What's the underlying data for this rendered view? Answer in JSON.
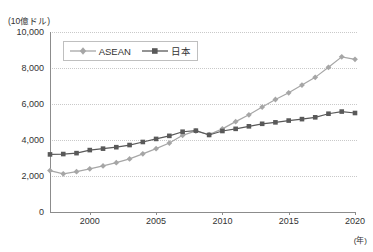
{
  "chart_data": {
    "type": "line",
    "title": "",
    "subtitle": "",
    "xlabel": "(年)",
    "ylabel": "(10億ドル)",
    "unit_label": "(10億ドル)",
    "year_label": "(年)",
    "xlim": [
      1997,
      2020
    ],
    "ylim": [
      0,
      10000
    ],
    "ytick_labels": [
      "0",
      "2,000",
      "4,000",
      "6,000",
      "8,000",
      "10,000"
    ],
    "ytick_values": [
      0,
      2000,
      4000,
      6000,
      8000,
      10000
    ],
    "xtick_labels": [
      "2000",
      "2005",
      "2010",
      "2015",
      "2020"
    ],
    "xtick_values": [
      2000,
      2005,
      2010,
      2015,
      2020
    ],
    "grid": true,
    "legend_position": "top-left-inside",
    "x": [
      1997,
      1998,
      1999,
      2000,
      2001,
      2002,
      2003,
      2004,
      2005,
      2006,
      2007,
      2008,
      2009,
      2010,
      2011,
      2012,
      2013,
      2014,
      2015,
      2016,
      2017,
      2018,
      2019,
      2020
    ],
    "series": [
      {
        "name": "ASEAN",
        "color": "#a6a6a6",
        "marker": "diamond",
        "values": [
          2300,
          2120,
          2240,
          2400,
          2560,
          2740,
          2950,
          3230,
          3520,
          3830,
          4260,
          4500,
          4300,
          4620,
          5020,
          5400,
          5830,
          6250,
          6620,
          7050,
          7480,
          8040,
          8620,
          8480
        ]
      },
      {
        "name": "日本",
        "color": "#595959",
        "marker": "square",
        "values": [
          3200,
          3220,
          3270,
          3440,
          3520,
          3600,
          3720,
          3890,
          4060,
          4230,
          4460,
          4520,
          4280,
          4500,
          4620,
          4760,
          4900,
          4980,
          5080,
          5160,
          5260,
          5460,
          5580,
          5500
        ]
      }
    ]
  },
  "legend": {
    "entries": [
      {
        "label": "ASEAN"
      },
      {
        "label": "日本"
      }
    ]
  },
  "colors": {
    "asean": "#a6a6a6",
    "japan": "#595959",
    "axis": "#8c8c8c",
    "grid": "#c9c9c9",
    "text": "#333333",
    "background": "#ffffff"
  }
}
